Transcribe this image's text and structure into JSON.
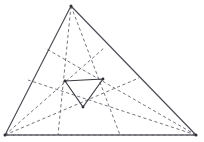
{
  "figure": {
    "canvas": {
      "width": 204,
      "height": 142
    },
    "colors": {
      "background": "#ffffff",
      "outer_stroke": "#4a4a52",
      "cevian_stroke": "#6e6e76",
      "inner_stroke": "#3a3a42",
      "vertex_dot": "#2f2f36"
    },
    "outer_triangle": {
      "name": "outer-triangle",
      "vertices": [
        {
          "label": "A",
          "x": 71,
          "y": 6
        },
        {
          "label": "B",
          "x": 5,
          "y": 135
        },
        {
          "label": "C",
          "x": 196,
          "y": 135
        }
      ],
      "path": "M71,6 L5,135 L196,135 Z"
    },
    "inner_triangle": {
      "name": "inner-triangle",
      "vertices": [
        {
          "label": "P",
          "x": 65,
          "y": 81
        },
        {
          "label": "Q",
          "x": 103,
          "y": 79
        },
        {
          "label": "R",
          "x": 83,
          "y": 107
        }
      ],
      "path": "M65,81 L103,79 L83,107 Z"
    },
    "cevians": [
      {
        "id": "cevian-a1",
        "from": "A",
        "to_x": 58,
        "to_y": 135,
        "path": "M71,6 L58,135"
      },
      {
        "id": "cevian-a2",
        "from": "A",
        "to_x": 120,
        "to_y": 135,
        "path": "M71,6 L120,135"
      },
      {
        "id": "cevian-b1",
        "from": "B",
        "to_x": 104,
        "to_y": 48,
        "path": "M5,135 L104,48"
      },
      {
        "id": "cevian-b2",
        "from": "B",
        "to_x": 139,
        "to_y": 78,
        "path": "M5,135 L139,78"
      },
      {
        "id": "cevian-b3",
        "from": "B",
        "to_x": 196,
        "to_y": 135,
        "path": "M5,135 L196,135"
      },
      {
        "id": "cevian-c1",
        "from": "C",
        "to_x": 45,
        "to_y": 48,
        "path": "M196,135 L45,48"
      },
      {
        "id": "cevian-c2",
        "from": "C",
        "to_x": 28,
        "to_y": 80,
        "path": "M196,135 L28,80"
      },
      {
        "id": "cevian-c3",
        "from": "C",
        "to_x": 5,
        "to_y": 135,
        "path": "M196,135 L5,135"
      }
    ],
    "vertex_markers": [
      {
        "id": "marker-apex",
        "x": 71,
        "y": 6,
        "r": 1.5
      },
      {
        "id": "marker-bottom-left",
        "x": 5,
        "y": 135,
        "r": 1.5
      },
      {
        "id": "marker-bottom-right",
        "x": 196,
        "y": 135,
        "r": 1.5
      },
      {
        "id": "marker-inner-left",
        "x": 65,
        "y": 81,
        "r": 1.4
      },
      {
        "id": "marker-inner-right",
        "x": 103,
        "y": 79,
        "r": 1.4
      },
      {
        "id": "marker-inner-bottom",
        "x": 83,
        "y": 107,
        "r": 1.4
      }
    ]
  }
}
